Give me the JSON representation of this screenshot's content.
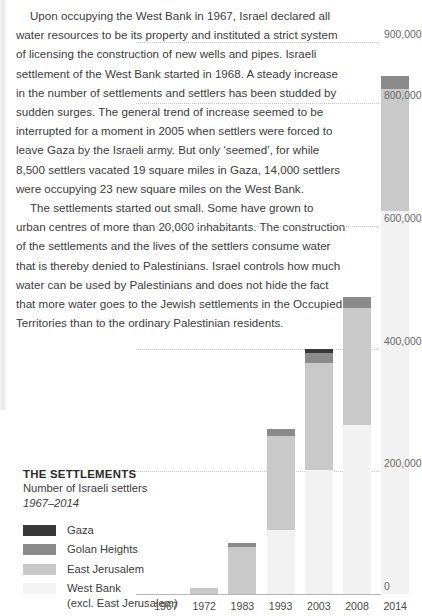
{
  "article": {
    "paragraphs": [
      "Upon occupying the West Bank in 1967, Israel declared all water resources to be its property and instituted a strict system of licensing the construction of new wells and pipes. Israeli settlement of the West Bank started in 1968. A steady increase in the number of settlements and settlers has been studded by sudden surges. The general trend of increase seemed to be interrupted for a moment in 2005 when settlers were forced to leave Gaza by the Israeli army. But only ‘seemed’, for while 8,500 settlers vacated 19 square miles in Gaza, 14,000 settlers were occupying 23 new square miles on the West Bank.",
      "The settlements started out small. Some have grown to urban centres of more than 20,000 inhabitants. The construction of the settlements and the lives of the settlers consume water that is thereby denied to Palestinians. Israel controls how much water can be used by Palestinians and does not hide the fact that more water goes to the Jewish settlements in the Occupied Territories than to the ordinary Palestinian residents."
    ]
  },
  "legend": {
    "title": "THE SETTLEMENTS",
    "subtitle": "Number of Israeli settlers",
    "years": "1967–2014",
    "items": [
      {
        "label": "Gaza",
        "sublabel": "",
        "color": "#383838"
      },
      {
        "label": "Golan Heights",
        "sublabel": "",
        "color": "#8b8b8b"
      },
      {
        "label": "East Jerusalem",
        "sublabel": "",
        "color": "#c9c9c9"
      },
      {
        "label": "West Bank",
        "sublabel": "(excl. East Jerusalem)",
        "color": "#f2f2f2"
      }
    ]
  },
  "chart_data": {
    "type": "bar",
    "stacked": true,
    "title": "THE SETTLEMENTS",
    "subtitle": "Number of Israeli settlers",
    "xlabel": "",
    "ylabel": "",
    "ylim": [
      0,
      900000
    ],
    "grid": true,
    "gridlines": [
      0,
      200000,
      400000,
      600000,
      800000,
      900000
    ],
    "ytick_labels": [
      "0",
      "200,000",
      "400,000",
      "600,000",
      "800,000",
      "900,000"
    ],
    "categories": [
      "1967",
      "1972",
      "1983",
      "1993",
      "2003",
      "2008",
      "2014"
    ],
    "series": [
      {
        "name": "West Bank (excl. East Jerusalem)",
        "color": "#f2f2f2",
        "values": [
          0,
          0,
          0,
          0,
          0,
          0,
          0
        ]
      },
      {
        "name": "East Jerusalem",
        "color": "#c9c9c9",
        "values": [
          0,
          10000,
          76000,
          152000,
          175000,
          190000,
          200000
        ]
      },
      {
        "name": "Golan Heights",
        "color": "#8b8b8b",
        "values": [
          0,
          0,
          6500,
          12000,
          16000,
          18000,
          21000
        ]
      },
      {
        "name": "Gaza",
        "color": "#383838",
        "values": [
          0,
          0,
          0,
          0,
          7500,
          0,
          0
        ]
      }
    ],
    "bar_totals": [
      0,
      10000,
      82500,
      269000,
      400000,
      484000,
      845000
    ],
    "legend_position": "lower-left"
  }
}
